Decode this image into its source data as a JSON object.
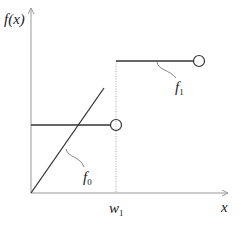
{
  "diagram": {
    "y_axis_label": "f(x)",
    "x_axis_label": "x",
    "threshold_label": "w",
    "threshold_subscript": "1",
    "functions": [
      {
        "name": "f",
        "subscript": "0",
        "description": "linear line through origin plus horizontal segment ending in open circle at w1"
      },
      {
        "name": "f",
        "subscript": "1",
        "description": "horizontal segment starting at w1 ending in open circle"
      }
    ],
    "colors": {
      "axis": "#999999",
      "line": "#333333",
      "dotted": "#aaaaaa",
      "text": "#222222"
    }
  }
}
